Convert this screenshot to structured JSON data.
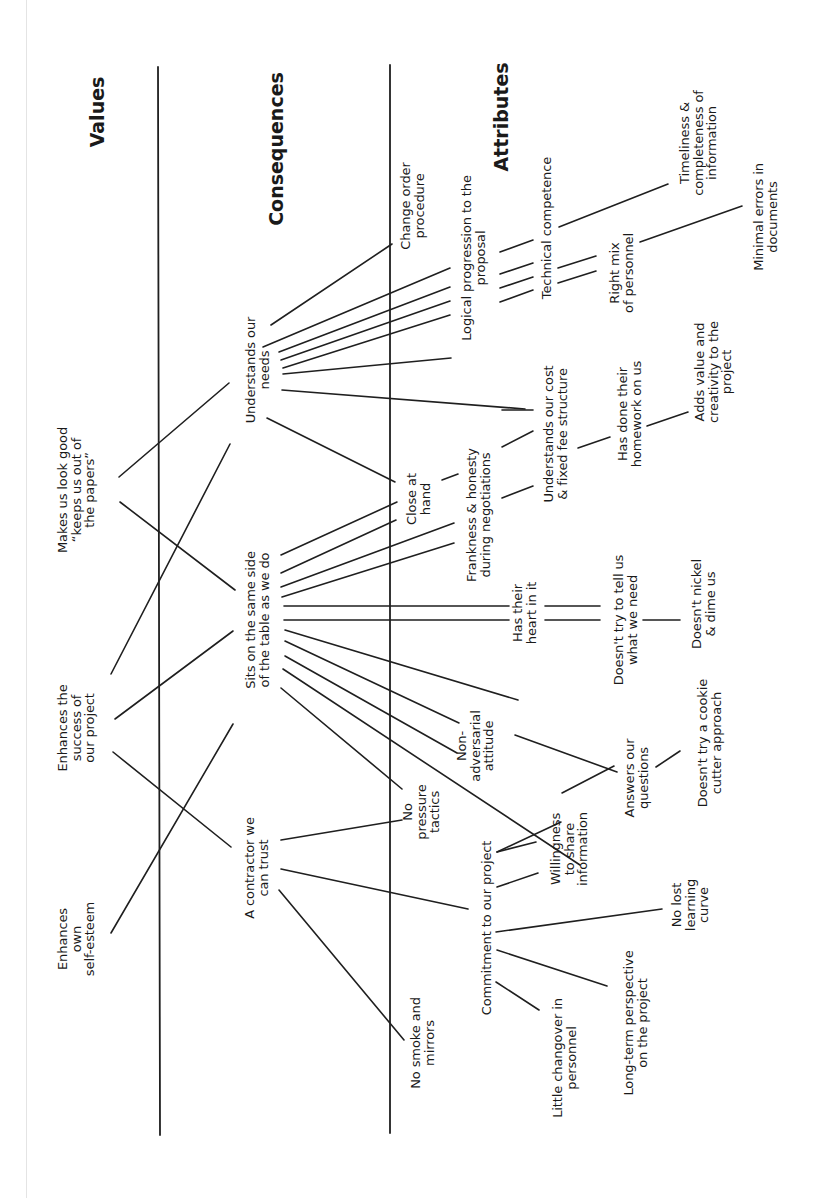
{
  "headings": {
    "values": "Values",
    "consequences": "Consequences",
    "attributes": "Attributes"
  },
  "values": [
    {
      "id": "v1",
      "text": "Makes us look good\n“keeps us out of\nthe papers”"
    },
    {
      "id": "v2",
      "text": "Enhances the\nsuccess of\nour project"
    },
    {
      "id": "v3",
      "text": "Enhances\nown\nself-esteem"
    }
  ],
  "consequences": [
    {
      "id": "c1",
      "text": "Understands our\nneeds"
    },
    {
      "id": "c2",
      "text": "Sits on the same side\nof the table as we do"
    },
    {
      "id": "c3",
      "text": "A contractor we\ncan trust"
    },
    {
      "id": "c4",
      "text": "Change order\nprocedure"
    },
    {
      "id": "c5",
      "text": "Logical progression to the\nproposal"
    },
    {
      "id": "c6",
      "text": "Close at\nhand"
    },
    {
      "id": "c7",
      "text": "No\npressure\ntactics"
    },
    {
      "id": "c8",
      "text": "No smoke and\nmirrors"
    },
    {
      "id": "c9",
      "text": "Frankness & honesty\nduring negotiations"
    },
    {
      "id": "c10",
      "text": "Has their\nheart in it"
    },
    {
      "id": "c11",
      "text": "Non-\nadversarial\nattitude"
    },
    {
      "id": "c12",
      "text": "Commitment to our project"
    }
  ],
  "attributes": [
    {
      "id": "a1",
      "text": "Technical competence"
    },
    {
      "id": "a2",
      "text": "Right mix\nof personnel"
    },
    {
      "id": "a3",
      "text": "Timeliness &\ncompleteness of\ninformation"
    },
    {
      "id": "a4",
      "text": "Minimal errors in\ndocuments"
    },
    {
      "id": "a5",
      "text": "Understands our cost\n& fixed fee structure"
    },
    {
      "id": "a6",
      "text": "Has done their\nhomework on us"
    },
    {
      "id": "a7",
      "text": "Adds value and\ncreativity to the\nproject"
    },
    {
      "id": "a8",
      "text": "Doesn't try to tell us\nwhat we need"
    },
    {
      "id": "a9",
      "text": "Doesn't nickel\n& dime us"
    },
    {
      "id": "a10",
      "text": "Doesn't try a cookie\ncutter approach"
    },
    {
      "id": "a11",
      "text": "Answers our\nquestions"
    },
    {
      "id": "a12",
      "text": "Willingness\nto share\ninformation"
    },
    {
      "id": "a13",
      "text": "No lost\nlearning\ncurve"
    },
    {
      "id": "a14",
      "text": "Long-term perspective\non the project"
    },
    {
      "id": "a15",
      "text": "Little changover in\npersonnel"
    }
  ]
}
